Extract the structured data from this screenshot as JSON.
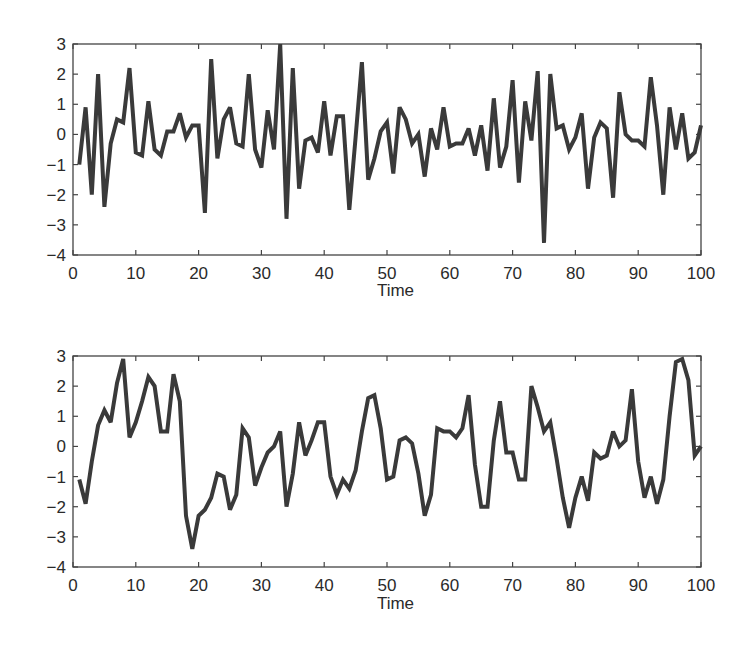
{
  "chart_data": [
    {
      "type": "line",
      "title": "",
      "xlabel": "Time",
      "ylabel": "",
      "xlim": [
        0,
        100
      ],
      "ylim": [
        -4,
        3
      ],
      "xticks": [
        0,
        10,
        20,
        30,
        40,
        50,
        60,
        70,
        80,
        90,
        100
      ],
      "yticks": [
        3,
        2,
        1,
        0,
        -1,
        -2,
        -3,
        -4
      ],
      "grid": false,
      "legend": null,
      "line_color": "#3a3a3a",
      "series": [
        {
          "name": "series_top",
          "x_start": 1,
          "x_step": 1,
          "values": [
            -1.0,
            0.9,
            -2.0,
            2.0,
            -2.4,
            -0.3,
            0.5,
            0.4,
            2.2,
            -0.6,
            -0.7,
            1.1,
            -0.5,
            -0.7,
            0.1,
            0.1,
            0.7,
            -0.1,
            0.3,
            0.3,
            -2.6,
            2.5,
            -0.8,
            0.5,
            0.9,
            -0.3,
            -0.4,
            2.0,
            -0.5,
            -1.1,
            0.8,
            -0.5,
            3.0,
            -2.8,
            2.2,
            -1.8,
            -0.2,
            -0.1,
            -0.6,
            1.1,
            -0.7,
            0.6,
            0.6,
            -2.5,
            -0.1,
            2.4,
            -1.5,
            -0.8,
            0.1,
            0.4,
            -1.3,
            0.9,
            0.5,
            -0.3,
            0.0,
            -1.4,
            0.2,
            -0.5,
            0.9,
            -0.4,
            -0.3,
            -0.3,
            0.2,
            -0.7,
            0.3,
            -1.2,
            1.2,
            -1.1,
            -0.4,
            1.8,
            -1.6,
            1.1,
            -0.2,
            2.1,
            -3.6,
            2.0,
            0.2,
            0.3,
            -0.5,
            -0.1,
            0.7,
            -1.8,
            -0.1,
            0.4,
            0.2,
            -2.1,
            1.4,
            0.0,
            -0.2,
            -0.2,
            -0.4,
            1.9,
            0.3,
            -2.0,
            0.9,
            -0.5,
            0.7,
            -0.8,
            -0.6,
            0.3
          ]
        }
      ]
    },
    {
      "type": "line",
      "title": "",
      "xlabel": "Time",
      "ylabel": "",
      "xlim": [
        0,
        100
      ],
      "ylim": [
        -4,
        3
      ],
      "xticks": [
        0,
        10,
        20,
        30,
        40,
        50,
        60,
        70,
        80,
        90,
        100
      ],
      "yticks": [
        3,
        2,
        1,
        0,
        -1,
        -2,
        -3,
        -4
      ],
      "grid": false,
      "legend": null,
      "line_color": "#3a3a3a",
      "series": [
        {
          "name": "series_bottom",
          "x_start": 1,
          "x_step": 1,
          "values": [
            -1.1,
            -1.9,
            -0.5,
            0.7,
            1.2,
            0.8,
            2.1,
            2.9,
            0.3,
            0.8,
            1.5,
            2.3,
            2.0,
            0.5,
            0.5,
            2.4,
            1.5,
            -2.3,
            -3.4,
            -2.3,
            -2.1,
            -1.7,
            -0.9,
            -1.0,
            -2.1,
            -1.6,
            0.6,
            0.3,
            -1.3,
            -0.7,
            -0.2,
            0.0,
            0.5,
            -2.0,
            -0.9,
            0.8,
            -0.3,
            0.2,
            0.8,
            0.8,
            -1.0,
            -1.6,
            -1.1,
            -1.4,
            -0.8,
            0.5,
            1.6,
            1.7,
            0.6,
            -1.1,
            -1.0,
            0.2,
            0.3,
            0.1,
            -0.9,
            -2.3,
            -1.6,
            0.6,
            0.5,
            0.5,
            0.3,
            0.6,
            1.7,
            -0.6,
            -2.0,
            -2.0,
            0.2,
            1.5,
            -0.2,
            -0.2,
            -1.1,
            -1.1,
            2.0,
            1.3,
            0.5,
            0.8,
            -0.4,
            -1.7,
            -2.7,
            -1.7,
            -1.0,
            -1.8,
            -0.2,
            -0.4,
            -0.3,
            0.5,
            0.0,
            0.2,
            1.9,
            -0.5,
            -1.7,
            -1.0,
            -1.9,
            -1.1,
            1.0,
            2.8,
            2.9,
            2.2,
            -0.3,
            0.0
          ]
        }
      ]
    }
  ],
  "charts": [
    {
      "xlabel": "Time"
    },
    {
      "xlabel": "Time"
    }
  ]
}
